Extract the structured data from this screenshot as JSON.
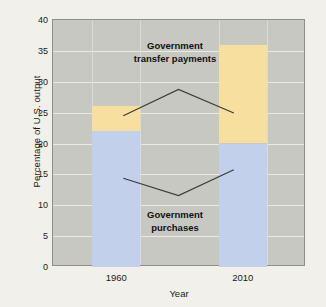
{
  "chart_data": {
    "type": "bar",
    "stacked": true,
    "title": "",
    "xlabel": "Year",
    "ylabel": "Percentage of U.S. output",
    "categories": [
      "1960",
      "2010"
    ],
    "series": [
      {
        "name": "Government purchases",
        "values": [
          22,
          20
        ],
        "color": "#c2d0ec"
      },
      {
        "name": "Government transfer payments",
        "values": [
          4,
          16
        ],
        "color": "#f7dfa0"
      }
    ],
    "totals": [
      26,
      36
    ],
    "ylim": [
      0,
      40
    ],
    "ytick_labels": [
      "0",
      "5",
      "10",
      "15",
      "20",
      "25",
      "30",
      "35",
      "40"
    ],
    "ytick_values": [
      0,
      5,
      10,
      15,
      20,
      25,
      30,
      35,
      40
    ],
    "grid": true,
    "legend": "annotations",
    "annotations": [
      {
        "text_line1": "Government",
        "text_line2": "transfer payments"
      },
      {
        "text_line1": "Government",
        "text_line2": "purchases"
      }
    ]
  },
  "colors": {
    "page_background": "#f2f0ea",
    "plot_background": "#c8c8c2",
    "gridline": "#eceae4",
    "frame": "#8f8f8a",
    "purchases": "#c2d0ec",
    "transfers": "#f7dfa0",
    "text": "#1a1a1a",
    "leader_line": "#3c3a33"
  }
}
